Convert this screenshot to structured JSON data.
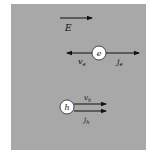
{
  "diagram": {
    "background_color": "#a8a8a8",
    "field": {
      "label": "E",
      "direction": "right"
    },
    "electron": {
      "symbol": "e",
      "velocity_label": "v",
      "velocity_sub": "e",
      "velocity_direction": "left",
      "current_label": "j",
      "current_sub": "e",
      "current_direction": "right"
    },
    "hole": {
      "symbol": "h",
      "velocity_label": "v",
      "velocity_sub": "h",
      "velocity_direction": "right",
      "current_label": "j",
      "current_sub": "h",
      "current_direction": "right"
    }
  }
}
